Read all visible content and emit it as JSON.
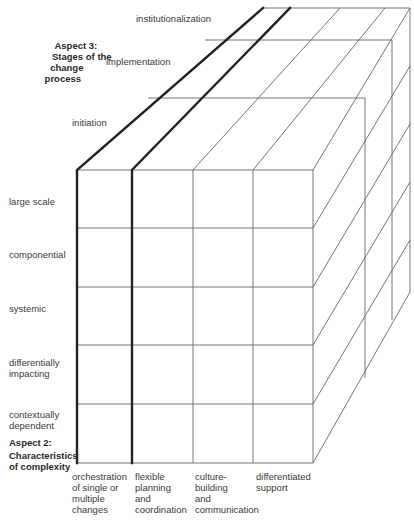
{
  "aspect3": {
    "title_line1": "Aspect 3:",
    "title_line2": "Stages of the",
    "title_line3": "change",
    "title_line4": "process",
    "stages": [
      "initiation",
      "implementation",
      "institutionalization"
    ]
  },
  "aspect2": {
    "title_line1": "Aspect 2:",
    "title_line2": "Characteristics",
    "title_line3": "of complexity",
    "rows": [
      {
        "line1": "large scale",
        "line2": ""
      },
      {
        "line1": "componential",
        "line2": ""
      },
      {
        "line1": "systemic",
        "line2": ""
      },
      {
        "line1": "differentially",
        "line2": "impacting"
      },
      {
        "line1": "contextually",
        "line2": "dependent"
      }
    ]
  },
  "columns": [
    {
      "lines": [
        "orchestration",
        "of single or",
        "multiple",
        "changes"
      ]
    },
    {
      "lines": [
        "flexible",
        "planning",
        "and",
        "coordination"
      ]
    },
    {
      "lines": [
        "culture-",
        "building",
        "and",
        "communication"
      ]
    },
    {
      "lines": [
        "differentiated",
        "support"
      ]
    }
  ],
  "colors": {
    "line": "#555555",
    "thick_line": "#222222",
    "text": "#3a3a3a"
  }
}
